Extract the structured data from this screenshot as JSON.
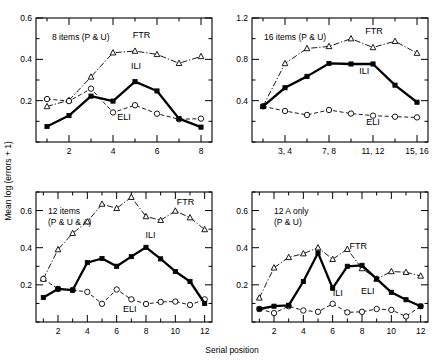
{
  "figure": {
    "y_axis_title": "Mean log (errors + 1)",
    "x_axis_title": "Serial position",
    "series_names": [
      "ILI",
      "ELI",
      "FTR"
    ]
  },
  "chart_data": [
    {
      "type": "line",
      "panel": "top-left",
      "title": "8 items (P & U)",
      "xlabel": "Serial position",
      "ylabel": "Mean log (errors + 1)",
      "xlim": [
        0.5,
        8.5
      ],
      "ylim": [
        0,
        0.6
      ],
      "yticks": [
        0,
        0.1,
        0.2,
        0.3,
        0.4,
        0.5,
        0.6
      ],
      "ytick_labels": [
        "",
        "",
        "0.2",
        "",
        "0.4",
        "",
        "0.6"
      ],
      "xticks": [
        1,
        2,
        3,
        4,
        5,
        6,
        7,
        8
      ],
      "xtick_labels": [
        "",
        "2",
        "",
        "4",
        "",
        "6",
        "",
        "8"
      ],
      "x": [
        1,
        2,
        3,
        4,
        5,
        6,
        7,
        8
      ],
      "grid": false,
      "legend": "inline-annotations",
      "series": [
        {
          "name": "ILI",
          "style": "solid-thick-filled-square",
          "values": [
            0.075,
            0.128,
            0.222,
            0.198,
            0.292,
            0.247,
            0.113,
            0.072
          ]
        },
        {
          "name": "ELI",
          "style": "dashed-open-circle",
          "values": [
            0.208,
            0.198,
            0.258,
            0.143,
            0.178,
            0.137,
            0.11,
            0.113
          ]
        },
        {
          "name": "FTR",
          "style": "dashdot-open-triangle",
          "values": [
            0.172,
            0.202,
            0.315,
            0.432,
            0.44,
            0.424,
            0.381,
            0.414
          ]
        }
      ]
    },
    {
      "type": "line",
      "panel": "top-right",
      "title": "16 items (P & U)",
      "xlabel": "Serial position",
      "ylabel": "Mean log (errors + 1)",
      "xlim": [
        0.5,
        8.5
      ],
      "ylim": [
        0,
        1.2
      ],
      "yticks": [
        0,
        0.2,
        0.4,
        0.6,
        0.8,
        1.0,
        1.2
      ],
      "ytick_labels": [
        "",
        "",
        "0.4",
        "",
        "0.8",
        "",
        "1.2"
      ],
      "xticks": [
        1,
        2,
        3,
        4,
        5,
        6,
        7,
        8
      ],
      "xtick_labels": [
        "",
        "3, 4",
        "",
        "7, 8",
        "",
        "11, 12",
        "",
        "15, 16"
      ],
      "x": [
        1,
        2,
        3,
        4,
        5,
        6,
        7,
        8
      ],
      "grid": false,
      "legend": "inline-annotations",
      "series": [
        {
          "name": "ILI",
          "style": "solid-thick-filled-square",
          "values": [
            0.345,
            0.525,
            0.635,
            0.76,
            0.755,
            0.755,
            0.55,
            0.385
          ]
        },
        {
          "name": "ELI",
          "style": "dashed-open-circle",
          "values": [
            0.345,
            0.3,
            0.262,
            0.31,
            0.275,
            0.255,
            0.245,
            0.238
          ]
        },
        {
          "name": "FTR",
          "style": "dashdot-open-triangle",
          "values": [
            0.345,
            0.76,
            0.905,
            0.925,
            1.0,
            0.915,
            0.975,
            0.86
          ]
        }
      ]
    },
    {
      "type": "line",
      "panel": "bottom-left",
      "title": "12 items (P & U & A)",
      "xlabel": "Serial position",
      "ylabel": "Mean log (errors + 1)",
      "xlim": [
        0.5,
        12.5
      ],
      "ylim": [
        0,
        0.7
      ],
      "yticks": [
        0,
        0.1,
        0.2,
        0.3,
        0.4,
        0.5,
        0.6,
        0.7
      ],
      "ytick_labels": [
        "",
        "",
        "0.2",
        "",
        "0.4",
        "",
        "0.6",
        ""
      ],
      "xticks": [
        1,
        2,
        3,
        4,
        5,
        6,
        7,
        8,
        9,
        10,
        11,
        12
      ],
      "xtick_labels": [
        "",
        "2",
        "",
        "4",
        "",
        "6",
        "",
        "8",
        "",
        "10",
        "",
        "12"
      ],
      "x": [
        1,
        2,
        3,
        4,
        5,
        6,
        7,
        8,
        9,
        10,
        11,
        12
      ],
      "grid": false,
      "legend": "inline-annotations",
      "series": [
        {
          "name": "ILI",
          "style": "solid-thick-filled-square",
          "values": [
            0.132,
            0.178,
            0.172,
            0.32,
            0.342,
            0.3,
            0.352,
            0.402,
            0.34,
            0.272,
            0.218,
            0.1
          ]
        },
        {
          "name": "ELI",
          "style": "dashed-open-circle",
          "values": [
            0.232,
            0.178,
            0.172,
            0.162,
            0.098,
            0.175,
            0.122,
            0.097,
            0.108,
            0.11,
            0.092,
            0.122
          ]
        },
        {
          "name": "FTR",
          "style": "dashdot-open-triangle",
          "values": [
            0.232,
            0.39,
            0.478,
            0.54,
            0.635,
            0.612,
            0.672,
            0.568,
            0.548,
            0.598,
            0.562,
            0.498
          ]
        }
      ]
    },
    {
      "type": "line",
      "panel": "bottom-right",
      "title": "12 A only (P & U)",
      "xlabel": "Serial position",
      "ylabel": "Mean log (errors + 1)",
      "xlim": [
        0.5,
        12.5
      ],
      "ylim": [
        0,
        0.7
      ],
      "yticks": [
        0,
        0.1,
        0.2,
        0.3,
        0.4,
        0.5,
        0.6,
        0.7
      ],
      "ytick_labels": [
        "",
        "",
        "0.2",
        "",
        "0.4",
        "",
        "0.6",
        ""
      ],
      "xticks": [
        1,
        2,
        3,
        4,
        5,
        6,
        7,
        8,
        9,
        10,
        11,
        12
      ],
      "xtick_labels": [
        "",
        "2",
        "",
        "4",
        "",
        "6",
        "",
        "8",
        "",
        "10",
        "",
        "12"
      ],
      "x": [
        1,
        2,
        3,
        4,
        5,
        6,
        7,
        8,
        9,
        10,
        11,
        12
      ],
      "grid": false,
      "legend": "inline-annotations",
      "series": [
        {
          "name": "ILI",
          "style": "solid-thick-filled-square",
          "values": [
            0.07,
            0.085,
            0.09,
            0.218,
            0.372,
            0.182,
            0.3,
            0.305,
            0.232,
            0.16,
            0.12,
            0.085
          ]
        },
        {
          "name": "ELI",
          "style": "dashed-open-circle",
          "values": [
            0.07,
            0.048,
            0.085,
            0.062,
            0.055,
            0.098,
            0.052,
            0.055,
            0.07,
            0.065,
            0.03,
            0.085
          ]
        },
        {
          "name": "FTR",
          "style": "dashdot-open-triangle",
          "values": [
            0.13,
            0.292,
            0.348,
            0.368,
            0.4,
            0.338,
            0.392,
            0.288,
            0.232,
            0.272,
            0.268,
            0.248
          ]
        }
      ]
    }
  ]
}
